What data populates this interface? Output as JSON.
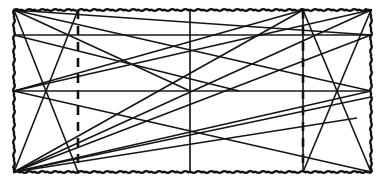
{
  "figure": {
    "width": 385,
    "height": 185,
    "background_color": "#ffffff",
    "line_color": "#141414"
  },
  "chart_data": {
    "type": "scatter",
    "subtitle": "",
    "xlabel": "",
    "ylabel": "",
    "xlim": [
      0,
      385
    ],
    "ylim": [
      0,
      185
    ],
    "grid": true,
    "legend_position": "none",
    "annotations": [],
    "tick_labels_x": [],
    "tick_labels_y": [],
    "frame": {
      "style": "wavy-dashed",
      "x0": 14,
      "y0": 10,
      "x1": 371,
      "y1": 172,
      "color": "#111111"
    },
    "grid_lines": {
      "vertical_x": [
        14,
        78,
        190,
        303,
        371
      ],
      "horizontal_y": [
        10,
        35,
        91,
        172
      ],
      "vertical_styles": [
        "wavy",
        "dashed",
        "solid",
        "dashed",
        "wavy"
      ],
      "horizontal_styles": [
        "wavy",
        "solid",
        "solid",
        "wavy"
      ]
    },
    "nodes": [
      {
        "id": "A",
        "label": "top-left",
        "x": 14,
        "y": 10
      },
      {
        "id": "B",
        "label": "top-inner-left",
        "x": 78,
        "y": 10
      },
      {
        "id": "C",
        "label": "top-center",
        "x": 190,
        "y": 10
      },
      {
        "id": "D",
        "label": "top-inner-right",
        "x": 303,
        "y": 10
      },
      {
        "id": "E",
        "label": "top-right",
        "x": 371,
        "y": 10
      },
      {
        "id": "F",
        "label": "mid-upper-left",
        "x": 14,
        "y": 35
      },
      {
        "id": "G",
        "label": "mid-upper-right",
        "x": 371,
        "y": 35
      },
      {
        "id": "H",
        "label": "mid-left",
        "x": 14,
        "y": 91
      },
      {
        "id": "I",
        "label": "center",
        "x": 190,
        "y": 91
      },
      {
        "id": "J",
        "label": "mid-right",
        "x": 371,
        "y": 91
      },
      {
        "id": "K",
        "label": "bottom-left",
        "x": 14,
        "y": 172
      },
      {
        "id": "L",
        "label": "bottom-inner-left",
        "x": 78,
        "y": 172
      },
      {
        "id": "M",
        "label": "bottom-center",
        "x": 190,
        "y": 172
      },
      {
        "id": "N",
        "label": "bottom-inner-right",
        "x": 303,
        "y": 172
      },
      {
        "id": "O",
        "label": "bottom-right",
        "x": 371,
        "y": 172
      }
    ],
    "edges": [
      {
        "from": "A",
        "to": "L",
        "x1": 14,
        "y1": 10,
        "x2": 78,
        "y2": 172
      },
      {
        "from": "A",
        "to": "J",
        "x1": 14,
        "y1": 10,
        "x2": 371,
        "y2": 91
      },
      {
        "from": "A",
        "to": "I",
        "x1": 14,
        "y1": 10,
        "x2": 190,
        "y2": 91
      },
      {
        "from": "B",
        "to": "K",
        "x1": 78,
        "y1": 10,
        "x2": 14,
        "y2": 172
      },
      {
        "from": "D",
        "to": "N",
        "x1": 303,
        "y1": 10,
        "x2": 303,
        "y2": 172
      },
      {
        "from": "D",
        "to": "O",
        "x1": 303,
        "y1": 10,
        "x2": 371,
        "y2": 172
      },
      {
        "from": "E",
        "to": "N",
        "x1": 371,
        "y1": 10,
        "x2": 303,
        "y2": 172
      },
      {
        "from": "E",
        "to": "H",
        "x1": 371,
        "y1": 10,
        "x2": 14,
        "y2": 91
      },
      {
        "from": "D",
        "to": "H",
        "x1": 303,
        "y1": 10,
        "x2": 14,
        "y2": 91
      },
      {
        "from": "D",
        "to": "K",
        "x1": 303,
        "y1": 10,
        "x2": 14,
        "y2": 172
      },
      {
        "from": "E",
        "to": "K",
        "x1": 371,
        "y1": 10,
        "x2": 14,
        "y2": 172
      },
      {
        "from": "K",
        "to": "G",
        "x1": 14,
        "y1": 172,
        "x2": 371,
        "y2": 35
      },
      {
        "from": "K",
        "to": "J",
        "x1": 14,
        "y1": 172,
        "x2": 371,
        "y2": 91
      },
      {
        "from": "K",
        "to": "Jb",
        "x1": 14,
        "y1": 172,
        "x2": 371,
        "y2": 97
      },
      {
        "from": "K",
        "to": "Nb",
        "x1": 14,
        "y1": 172,
        "x2": 357,
        "y2": 118
      },
      {
        "from": "H",
        "to": "O",
        "x1": 14,
        "y1": 91,
        "x2": 371,
        "y2": 172
      },
      {
        "from": "A",
        "to": "Gx",
        "x1": 14,
        "y1": 10,
        "x2": 371,
        "y2": 35
      },
      {
        "from": "F",
        "to": "Ix",
        "x1": 14,
        "y1": 35,
        "x2": 239,
        "y2": 91
      }
    ]
  }
}
